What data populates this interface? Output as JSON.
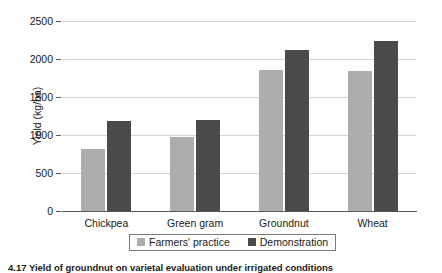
{
  "chart_data": {
    "type": "bar",
    "title": "",
    "xlabel": "",
    "ylabel": "Yield (kg/ha)",
    "categories": [
      "Chickpea",
      "Green gram",
      "Groundnut",
      "Wheat"
    ],
    "series": [
      {
        "name": "Farmers' practice",
        "color": "#adadad",
        "values": [
          815,
          975,
          1855,
          1845
        ]
      },
      {
        "name": "Demonstration",
        "color": "#4a4a4a",
        "values": [
          1185,
          1200,
          2120,
          2240
        ]
      }
    ],
    "ylim": [
      0,
      2500
    ],
    "yticks": [
      0,
      500,
      1000,
      1500,
      2000,
      2500
    ],
    "ytick_labels": [
      "0",
      "500",
      "1000",
      "1500",
      "2000",
      "2500"
    ],
    "grid": true,
    "legend_position": "bottom"
  },
  "legend": {
    "entries": [
      {
        "label": "Farmers' practice"
      },
      {
        "label": "Demonstration"
      }
    ]
  },
  "caption": {
    "text": "4.17  Yield of groundnut on varietal evaluation under irrigated conditions"
  }
}
